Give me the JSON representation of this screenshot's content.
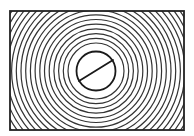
{
  "diagram": {
    "type": "concentric-rings-in-rectangle",
    "canvas": {
      "width": 194,
      "height": 136
    },
    "frame": {
      "x": 10,
      "y": 11,
      "width": 174,
      "height": 119,
      "stroke": "#222222",
      "stroke_width": 1.8
    },
    "center": {
      "x": 96,
      "y": 71
    },
    "inner_circle": {
      "r": 19.5,
      "stroke": "#1a1a1a",
      "stroke_width": 1.8
    },
    "diagonal": {
      "x1": 79,
      "y1": 81,
      "x2": 113,
      "y2": 60,
      "stroke": "#1a1a1a",
      "stroke_width": 1.8
    },
    "rings": {
      "r_start": 28,
      "r_end": 116,
      "step": 4.7,
      "stroke": "#333333",
      "stroke_width": 1.2
    },
    "background": "#ffffff"
  }
}
